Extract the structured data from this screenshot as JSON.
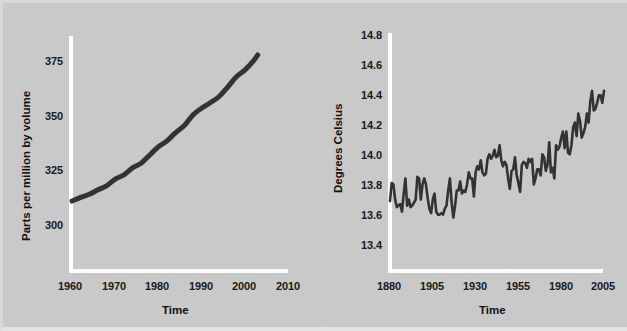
{
  "figure": {
    "background_color": "#c9c9c9",
    "axis_color": "#ffffff",
    "line_color": "#333333"
  },
  "chart_data": [
    {
      "id": "co2",
      "type": "line",
      "title": "",
      "xlabel": "Time",
      "ylabel": "Parts per million by volume",
      "xlim": [
        1960,
        2010
      ],
      "ylim": [
        290,
        382
      ],
      "xticks": [
        1960,
        1970,
        1980,
        1990,
        2000,
        2010
      ],
      "yticks": [
        300,
        325,
        350,
        375
      ],
      "grid": false,
      "legend": "none",
      "series": [
        {
          "name": "Atmospheric CO2 concentration",
          "x": [
            1960,
            1962,
            1964,
            1966,
            1968,
            1970,
            1972,
            1974,
            1976,
            1978,
            1980,
            1982,
            1984,
            1986,
            1988,
            1990,
            1992,
            1994,
            1996,
            1998,
            2000,
            2002,
            2003
          ],
          "values": [
            316.9,
            318.4,
            319.6,
            321.4,
            323.0,
            325.7,
            327.4,
            330.2,
            332.1,
            335.4,
            338.7,
            341.1,
            344.4,
            347.2,
            351.5,
            354.2,
            356.4,
            358.8,
            362.6,
            366.7,
            369.5,
            373.2,
            375.6
          ]
        }
      ]
    },
    {
      "id": "temperature",
      "type": "line",
      "title": "",
      "xlabel": "Time",
      "ylabel": "Degrees Celsius",
      "xlim": [
        1880,
        2005
      ],
      "ylim": [
        13.3,
        14.85
      ],
      "xticks": [
        1880,
        1905,
        1930,
        1955,
        1980,
        2005
      ],
      "yticks": [
        13.4,
        13.6,
        13.8,
        14.0,
        14.2,
        14.4,
        14.6,
        14.8
      ],
      "grid": false,
      "legend": "none",
      "series": [
        {
          "name": "Global mean surface temperature",
          "x": [
            1880,
            1881,
            1882,
            1883,
            1884,
            1885,
            1886,
            1887,
            1888,
            1889,
            1890,
            1891,
            1892,
            1893,
            1894,
            1895,
            1896,
            1897,
            1898,
            1899,
            1900,
            1901,
            1902,
            1903,
            1904,
            1905,
            1906,
            1907,
            1908,
            1909,
            1910,
            1911,
            1912,
            1913,
            1914,
            1915,
            1916,
            1917,
            1918,
            1919,
            1920,
            1921,
            1922,
            1923,
            1924,
            1925,
            1926,
            1927,
            1928,
            1929,
            1930,
            1931,
            1932,
            1933,
            1934,
            1935,
            1936,
            1937,
            1938,
            1939,
            1940,
            1941,
            1942,
            1943,
            1944,
            1945,
            1946,
            1947,
            1948,
            1949,
            1950,
            1951,
            1952,
            1953,
            1954,
            1955,
            1956,
            1957,
            1958,
            1959,
            1960,
            1961,
            1962,
            1963,
            1964,
            1965,
            1966,
            1967,
            1968,
            1969,
            1970,
            1971,
            1972,
            1973,
            1974,
            1975,
            1976,
            1977,
            1978,
            1979,
            1980,
            1981,
            1982,
            1983,
            1984,
            1985,
            1986,
            1987,
            1988,
            1989,
            1990,
            1991,
            1992,
            1993,
            1994,
            1995,
            1996,
            1997,
            1998,
            1999,
            2000,
            2001,
            2002,
            2003,
            2004,
            2005
          ],
          "values": [
            13.75,
            13.87,
            13.86,
            13.76,
            13.71,
            13.72,
            13.73,
            13.68,
            13.8,
            13.9,
            13.72,
            13.76,
            13.71,
            13.72,
            13.74,
            13.76,
            13.91,
            13.9,
            13.76,
            13.86,
            13.9,
            13.86,
            13.77,
            13.7,
            13.67,
            13.76,
            13.8,
            13.68,
            13.66,
            13.66,
            13.67,
            13.66,
            13.7,
            13.72,
            13.82,
            13.9,
            13.74,
            13.64,
            13.72,
            13.82,
            13.82,
            13.88,
            13.8,
            13.82,
            13.81,
            13.86,
            13.94,
            13.9,
            13.9,
            13.78,
            13.94,
            13.98,
            13.96,
            14.02,
            13.94,
            13.92,
            13.93,
            14.03,
            14.06,
            14.03,
            14.05,
            14.09,
            14.04,
            14.05,
            14.12,
            14.02,
            13.98,
            14.01,
            13.99,
            13.9,
            13.83,
            13.95,
            13.96,
            14.04,
            13.92,
            13.87,
            13.81,
            13.99,
            14.01,
            14.0,
            13.97,
            14.03,
            14.01,
            14.03,
            13.86,
            13.9,
            13.96,
            13.96,
            13.92,
            14.06,
            14.04,
            13.95,
            13.99,
            14.14,
            13.94,
            13.97,
            13.9,
            14.12,
            14.09,
            14.11,
            14.17,
            14.21,
            14.1,
            14.21,
            14.07,
            14.06,
            14.12,
            14.24,
            14.27,
            14.18,
            14.33,
            14.28,
            14.17,
            14.2,
            14.24,
            14.33,
            14.27,
            14.41,
            14.48,
            14.35,
            14.36,
            14.4,
            14.45,
            14.45,
            14.4,
            14.48
          ]
        }
      ]
    }
  ],
  "panels": {
    "co2": {
      "ylabel": "Parts per million by volume",
      "xlabel": "Time",
      "yticks": [
        "375",
        "350",
        "325",
        "300"
      ],
      "xticks": [
        "1960",
        "1970",
        "1980",
        "1990",
        "2000",
        "2010"
      ]
    },
    "temperature": {
      "ylabel": "Degrees Celsius",
      "xlabel": "Time",
      "yticks": [
        "14.8",
        "14.6",
        "14.4",
        "14.2",
        "14.0",
        "13.8",
        "13.6",
        "13.4"
      ],
      "xticks": [
        "1880",
        "1905",
        "1930",
        "1955",
        "1980",
        "2005"
      ]
    }
  }
}
